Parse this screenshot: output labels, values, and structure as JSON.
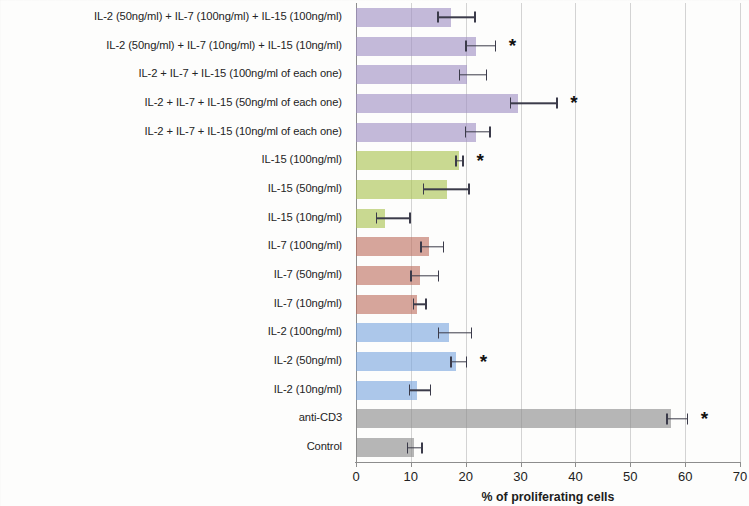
{
  "chart_data": {
    "type": "bar",
    "orientation": "horizontal",
    "title": "",
    "xlabel": "% of proliferating cells",
    "ylabel": "",
    "xlim": [
      0,
      70
    ],
    "xticks": [
      0,
      10,
      20,
      30,
      40,
      50,
      60,
      70
    ],
    "grid": true,
    "legend": "none",
    "significance_marker": "*",
    "categories": [
      "IL-2 (50ng/ml) + IL-7 (100ng/ml) + IL-15 (100ng/ml)",
      "IL-2 (50ng/ml) + IL-7 (10ng/ml) + IL-15 (10ng/ml)",
      "IL-2 + IL-7 + IL-15 (100ng/ml of each one)",
      "IL-2 + IL-7 + IL-15 (50ng/ml of each one)",
      "IL-2 + IL-7 + IL-15 (10ng/ml of each one)",
      "IL-15 (100ng/ml)",
      "IL-15 (50ng/ml)",
      "IL-15 (10ng/ml)",
      "IL-7 (100ng/ml)",
      "IL-7 (50ng/ml)",
      "IL-7 (10ng/ml)",
      "IL-2 (100ng/ml)",
      "IL-2 (50ng/ml)",
      "IL-2 (10ng/ml)",
      "anti-CD3",
      "Control"
    ],
    "values": [
      17.4,
      21.9,
      20.2,
      29.6,
      21.8,
      18.7,
      16.6,
      5.2,
      13.3,
      11.6,
      11.2,
      17.0,
      18.2,
      11.2,
      57.5,
      10.5
    ],
    "error_low": [
      2.6,
      2.0,
      1.5,
      1.6,
      2.0,
      0.6,
      4.4,
      1.6,
      1.6,
      1.7,
      0.9,
      2.1,
      1.0,
      1.6,
      0.9,
      1.2
    ],
    "error_high": [
      4.2,
      3.4,
      3.5,
      6.9,
      2.5,
      0.7,
      3.9,
      4.5,
      2.5,
      3.3,
      1.4,
      3.9,
      1.8,
      2.3,
      2.8,
      1.4
    ],
    "significant": [
      false,
      true,
      false,
      true,
      false,
      true,
      false,
      false,
      false,
      false,
      false,
      false,
      true,
      false,
      true,
      false
    ],
    "bar_colors": [
      "#9f8fc4",
      "#9f8fc4",
      "#9f8fc4",
      "#9f8fc4",
      "#9f8fc4",
      "#a9c44f",
      "#a9c44f",
      "#a9c44f",
      "#bf7060",
      "#bf7060",
      "#bf7060",
      "#7aa7de",
      "#7aa7de",
      "#7aa7de",
      "#8a8a8a",
      "#8a8a8a"
    ],
    "group_names": [
      "triple-combination",
      "triple-combination",
      "triple-combination",
      "triple-combination",
      "triple-combination",
      "IL-15",
      "IL-15",
      "IL-15",
      "IL-7",
      "IL-7",
      "IL-7",
      "IL-2",
      "IL-2",
      "IL-2",
      "control",
      "control"
    ]
  },
  "axis": {
    "tick_labels": [
      "0",
      "10",
      "20",
      "30",
      "40",
      "50",
      "60",
      "70"
    ],
    "x_title": "% of proliferating cells"
  },
  "colors": {
    "purple": "#9f8fc4",
    "green": "#a9c44f",
    "brown": "#bf7060",
    "blue": "#7aa7de",
    "gray": "#8a8a8a",
    "gridline": "#d3d3d3",
    "axis": "#8d8d8d",
    "text": "#242424"
  }
}
